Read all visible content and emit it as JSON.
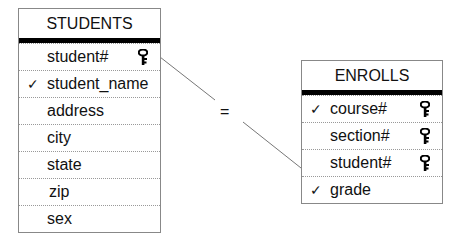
{
  "entities": {
    "students": {
      "title": "STUDENTS",
      "attributes": [
        {
          "name": "student#",
          "check": "",
          "key": true
        },
        {
          "name": "student_name",
          "check": "✓",
          "key": false
        },
        {
          "name": "address",
          "check": "",
          "key": false
        },
        {
          "name": "city",
          "check": "",
          "key": false
        },
        {
          "name": "state",
          "check": "",
          "key": false
        },
        {
          "name": "zip",
          "check": "",
          "key": false
        },
        {
          "name": "sex",
          "check": "",
          "key": false
        }
      ]
    },
    "enrolls": {
      "title": "ENROLLS",
      "attributes": [
        {
          "name": "course#",
          "check": "✓",
          "key": true
        },
        {
          "name": "section#",
          "check": "",
          "key": true
        },
        {
          "name": "student#",
          "check": "",
          "key": true
        },
        {
          "name": "grade",
          "check": "✓",
          "key": false
        }
      ]
    }
  },
  "relationship": {
    "symbol": "="
  }
}
